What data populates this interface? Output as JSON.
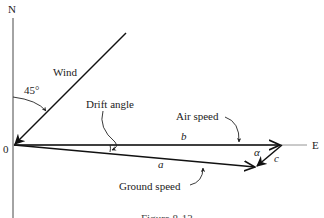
{
  "figure": {
    "axes": {
      "north_label": "N",
      "east_label": "E",
      "origin_label": "0"
    },
    "angle_label": "45°",
    "wind_label": "Wind",
    "drift_angle_label": "Drift angle",
    "air_speed_label": "Air speed",
    "ground_speed_label": "Ground speed",
    "vector_labels": {
      "a": "a",
      "b": "b",
      "c": "c",
      "alpha": "α"
    },
    "caption": "Figure 8-13"
  }
}
